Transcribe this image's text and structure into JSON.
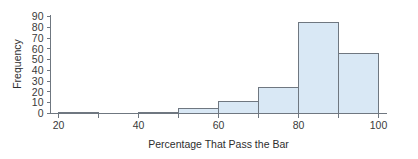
{
  "chart_data": {
    "type": "bar",
    "title": "",
    "xlabel": "Percentage That Pass the Bar",
    "ylabel": "Frequency",
    "bin_width": 10,
    "bin_edges": [
      20,
      30,
      40,
      50,
      60,
      70,
      80,
      90,
      100
    ],
    "categories": [
      "20-30",
      "30-40",
      "40-50",
      "50-60",
      "60-70",
      "70-80",
      "80-90",
      "90-100"
    ],
    "values": [
      1,
      0,
      1,
      5,
      11,
      24,
      85,
      56
    ],
    "xlim": [
      18,
      102
    ],
    "ylim": [
      0,
      92
    ],
    "xticks": [
      20,
      30,
      40,
      50,
      60,
      70,
      80,
      90,
      100
    ],
    "xtick_labels": [
      "20",
      "",
      "40",
      "",
      "60",
      "",
      "80",
      "",
      "100"
    ],
    "yticks": [
      0,
      10,
      20,
      30,
      40,
      50,
      60,
      70,
      80,
      90
    ],
    "ytick_labels": [
      "0",
      "10",
      "20",
      "30",
      "40",
      "50",
      "60",
      "70",
      "80",
      "90"
    ],
    "grid": false,
    "legend": null,
    "bar_fill_color": "#d9e8f5",
    "bar_edge_color": "#6f7780",
    "axis_color": "#6f7780",
    "text_color": "#3a3a3a"
  }
}
